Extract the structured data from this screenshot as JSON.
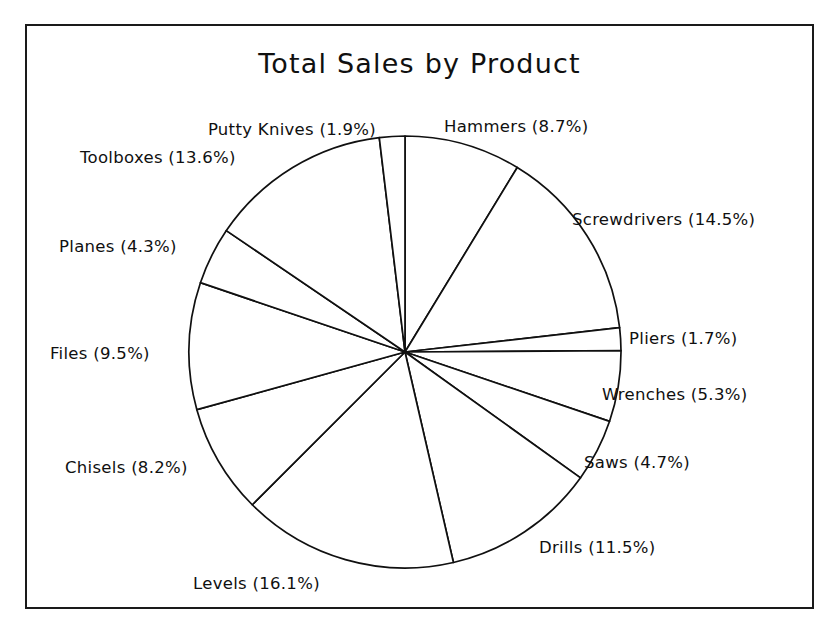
{
  "chart_data": {
    "type": "pie",
    "title": "Total Sales by Product",
    "xlabel": "",
    "ylabel": "",
    "legend": "none",
    "grid": false,
    "start_angle_deg": 90,
    "direction": "clockwise",
    "units": "percent",
    "categories": [
      "Hammers",
      "Screwdrivers",
      "Pliers",
      "Wrenches",
      "Saws",
      "Drills",
      "Levels",
      "Chisels",
      "Files",
      "Planes",
      "Toolboxes",
      "Putty Knives"
    ],
    "values": [
      8.7,
      14.5,
      1.7,
      5.3,
      4.7,
      11.5,
      16.1,
      8.2,
      9.5,
      4.3,
      13.6,
      1.9
    ],
    "slices": [
      {
        "name": "Hammers",
        "percent": 8.7,
        "label": "Hammers (8.7%)"
      },
      {
        "name": "Screwdrivers",
        "percent": 14.5,
        "label": "Screwdrivers (14.5%)"
      },
      {
        "name": "Pliers",
        "percent": 1.7,
        "label": "Pliers (1.7%)"
      },
      {
        "name": "Wrenches",
        "percent": 5.3,
        "label": "Wrenches (5.3%)"
      },
      {
        "name": "Saws",
        "percent": 4.7,
        "label": "Saws (4.7%)"
      },
      {
        "name": "Drills",
        "percent": 11.5,
        "label": "Drills (11.5%)"
      },
      {
        "name": "Levels",
        "percent": 16.1,
        "label": "Levels (16.1%)"
      },
      {
        "name": "Chisels",
        "percent": 8.2,
        "label": "Chisels (8.2%)"
      },
      {
        "name": "Files",
        "percent": 9.5,
        "label": "Files (9.5%)"
      },
      {
        "name": "Planes",
        "percent": 4.3,
        "label": "Planes (4.3%)"
      },
      {
        "name": "Toolboxes",
        "percent": 13.6,
        "label": "Toolboxes (13.6%)"
      },
      {
        "name": "Putty Knives",
        "percent": 1.9,
        "label": "Putty Knives (1.9%)"
      }
    ],
    "style": {
      "slice_fill": "#ffffff",
      "slice_stroke": "#101010",
      "frame_stroke": "#1a1a1a",
      "background": "#ffffff"
    },
    "geometry": {
      "center_x": 378,
      "center_y": 326,
      "radius": 216
    }
  },
  "labels": {
    "putty_knives": "Putty Knives (1.9%)",
    "toolboxes": "Toolboxes (13.6%)",
    "planes": "Planes (4.3%)",
    "files": "Files (9.5%)",
    "chisels": "Chisels (8.2%)",
    "levels": "Levels (16.1%)",
    "drills": "Drills (11.5%)",
    "saws": "Saws (4.7%)",
    "wrenches": "Wrenches (5.3%)",
    "pliers": "Pliers (1.7%)",
    "screwdrivers": "Screwdrivers (14.5%)",
    "hammers": "Hammers (8.7%)"
  }
}
